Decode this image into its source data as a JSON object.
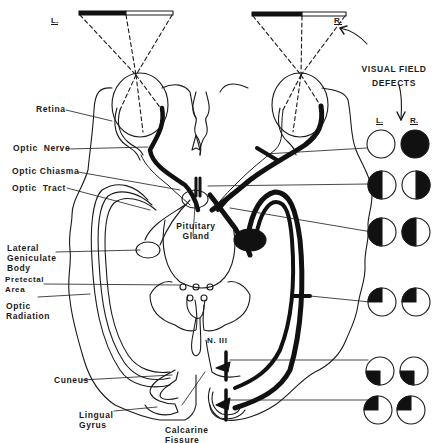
{
  "diagram": {
    "topic": "Visual pathway lesions and visual field defects",
    "eye_labels": {
      "left": "L.",
      "right": "R."
    },
    "visual_field_header": {
      "line1": "VISUAL FIELD",
      "line2": "DEFECTS"
    },
    "field_column_labels": {
      "left": "L.",
      "right": "R."
    },
    "anatomy_labels": {
      "retina": "Retina",
      "optic_nerve": "Optic  Nerve",
      "optic_chiasma": "Optic Chiasma",
      "optic_tract": "Optic  Tract",
      "lateral_geniculate_body": "Lateral\nGeniculate\nBody",
      "pretectal_area": "Pretectal\nArea",
      "optic_radiation": "Optic\nRadiation",
      "cuneus": "Cuneus",
      "lingual_gyrus": "Lingual\nGyrus",
      "pituitary_gland": "Pituitary\nGland",
      "calcarine_fissure": "Calcarine\nFissure",
      "n_iii": "N. III"
    },
    "visual_field_defects": [
      {
        "lesion": "Right optic nerve",
        "left_eye": "normal",
        "right_eye": "total blindness"
      },
      {
        "lesion": "Optic chiasma",
        "left_eye": "temporal hemianopia (left half dark)",
        "right_eye": "temporal hemianopia (right half dark)"
      },
      {
        "lesion": "Right optic tract",
        "left_eye": "left half dark",
        "right_eye": "left half dark"
      },
      {
        "lesion": "Right optic radiation (Meyer loop)",
        "left_eye": "upper-left quadrant dark",
        "right_eye": "upper-left quadrant dark"
      },
      {
        "lesion": "Right cuneus",
        "left_eye": "lower-left quadrant dark",
        "right_eye": "lower-left quadrant dark"
      },
      {
        "lesion": "Right lingual gyrus",
        "left_eye": "upper-left quadrant dark",
        "right_eye": "upper-left quadrant dark"
      }
    ]
  }
}
